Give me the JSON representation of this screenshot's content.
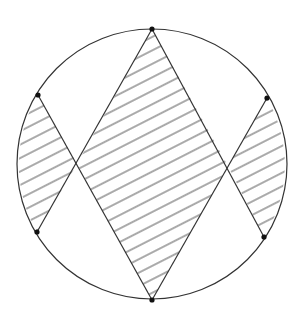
{
  "diagram": {
    "width": 301,
    "height": 326,
    "background": "#ffffff",
    "stroke_color": "#333333",
    "hatch_color": "#555555",
    "point_color": "#111111",
    "circle": {
      "cx": 152,
      "cy": 164,
      "r": 135
    },
    "points": [
      {
        "name": "top",
        "x": 152,
        "y": 29
      },
      {
        "name": "bottom",
        "x": 152,
        "y": 300
      },
      {
        "name": "left-upper",
        "x": 38,
        "y": 95
      },
      {
        "name": "left-lower",
        "x": 37,
        "y": 232
      },
      {
        "name": "right-upper",
        "x": 267,
        "y": 98
      },
      {
        "name": "right-lower",
        "x": 264,
        "y": 237
      }
    ],
    "segments": [
      [
        "top",
        "bottom-left-chord"
      ],
      [
        "top",
        "bottom-right-chord"
      ]
    ],
    "intersections": {
      "left": {
        "x": 77,
        "y": 164
      },
      "right": {
        "x": 228,
        "y": 166
      }
    },
    "hatch": {
      "angle_deg": -27,
      "spacing": 11.6,
      "stroke_width": 1
    },
    "shaded_regions": [
      "left-segment",
      "central-rhombus",
      "right-segment"
    ]
  }
}
